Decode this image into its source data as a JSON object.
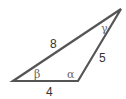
{
  "diagram": {
    "type": "triangle",
    "stroke_color": "#555555",
    "sides": [
      {
        "label": "8",
        "between": "left-vertex and top-vertex"
      },
      {
        "label": "5",
        "between": "bottom-right-vertex and top-vertex"
      },
      {
        "label": "4",
        "between": "left-vertex and bottom-right-vertex"
      }
    ],
    "angles": [
      {
        "label": "β",
        "vertex": "left"
      },
      {
        "label": "α",
        "vertex": "bottom-right"
      },
      {
        "label": "γ",
        "vertex": "top"
      }
    ]
  }
}
